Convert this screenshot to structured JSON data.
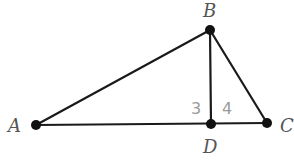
{
  "diagram": {
    "type": "geometry-triangle",
    "points": {
      "A": {
        "label": "A",
        "x": 36,
        "y": 125
      },
      "B": {
        "label": "B",
        "x": 210,
        "y": 30
      },
      "C": {
        "label": "C",
        "x": 267,
        "y": 123
      },
      "D": {
        "label": "D",
        "x": 211,
        "y": 124
      }
    },
    "segments": [
      {
        "from": "A",
        "to": "B"
      },
      {
        "from": "B",
        "to": "C"
      },
      {
        "from": "A",
        "to": "C"
      },
      {
        "from": "B",
        "to": "D"
      }
    ],
    "angle_labels": [
      {
        "label": "3",
        "at": "D",
        "side": "left"
      },
      {
        "label": "4",
        "at": "D",
        "side": "right"
      }
    ],
    "colors": {
      "line": "#1a1a1a",
      "point": "#111111",
      "point_label": "#555555",
      "angle_label": "#9a9a9a"
    }
  }
}
